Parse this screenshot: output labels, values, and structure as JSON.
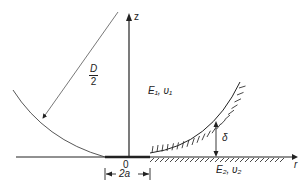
{
  "figure": {
    "axes": {
      "vertical_label": "z",
      "horizontal_label": "r",
      "origin_label": "0"
    },
    "labels": {
      "radius_numerator": "D",
      "radius_denominator": "2",
      "upper_body": "E₁, υ₁",
      "lower_body": "E₂, υ₂",
      "gap": "δ",
      "contact_width": "2a"
    },
    "colors": {
      "line": "#222222",
      "thin_line": "#555555",
      "background": "#ffffff"
    }
  }
}
